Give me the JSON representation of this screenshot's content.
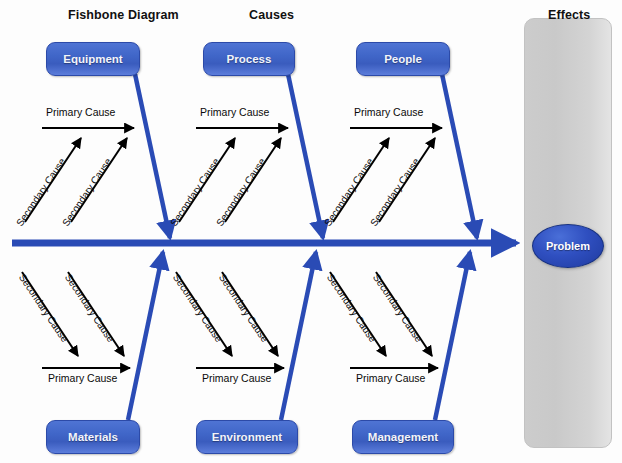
{
  "diagram": {
    "title": "Fishbone Diagram",
    "headings": [
      {
        "label": "Fishbone Diagram",
        "x": 68,
        "y": 8
      },
      {
        "label": "Causes",
        "x": 249,
        "y": 8
      },
      {
        "label": "Effects",
        "x": 548,
        "y": 8
      }
    ],
    "spine": {
      "color": "#2a4bb5",
      "start_x": 12,
      "end_x": 522,
      "y": 243,
      "thickness": 7
    },
    "effects_panel": {
      "label": "Effects",
      "x": 524,
      "y": 18,
      "width": 86,
      "height": 428,
      "color": "#cfcfcf"
    },
    "problem": {
      "label": "Problem",
      "x": 532,
      "y": 224,
      "width": 70,
      "height": 42,
      "color": "#2f4fc0"
    },
    "accent_color": "#3a5cbe",
    "arrow_color": "#000000",
    "branch_color": "#2a4bb5",
    "primary_cause_label": "Primary Cause",
    "secondary_cause_label": "Secondary Cause",
    "categories_top": [
      {
        "label": "Equipment",
        "box_x": 46,
        "box_y": 42,
        "box_w": 92,
        "box_h": 32
      },
      {
        "label": "Process",
        "box_x": 203,
        "box_y": 42,
        "box_w": 90,
        "box_h": 32
      },
      {
        "label": "People",
        "box_x": 356,
        "box_y": 42,
        "box_w": 92,
        "box_h": 32
      }
    ],
    "categories_bottom": [
      {
        "label": "Materials",
        "box_x": 46,
        "box_y": 420,
        "box_w": 92,
        "box_h": 32
      },
      {
        "label": "Environment",
        "box_x": 196,
        "box_y": 420,
        "box_w": 100,
        "box_h": 32
      },
      {
        "label": "Management",
        "box_x": 352,
        "box_y": 420,
        "box_w": 100,
        "box_h": 32
      }
    ],
    "branches_top": [
      {
        "category": "Equipment",
        "primary_label": "Primary Cause",
        "secondary_labels": [
          "Secondary Cause",
          "Secondary Cause"
        ]
      },
      {
        "category": "Process",
        "primary_label": "Primary Cause",
        "secondary_labels": [
          "Secondary Cause",
          "Secondary Cause"
        ]
      },
      {
        "category": "People",
        "primary_label": "Primary Cause",
        "secondary_labels": [
          "Secondary Cause",
          "Secondary Cause"
        ]
      }
    ],
    "branches_bottom": [
      {
        "category": "Materials",
        "primary_label": "Primary Cause",
        "secondary_labels": [
          "Secondary Cause",
          "Secondary Cause"
        ]
      },
      {
        "category": "Environment",
        "primary_label": "Primary Cause",
        "secondary_labels": [
          "Secondary Cause",
          "Secondary Cause"
        ]
      },
      {
        "category": "Management",
        "primary_label": "Primary Cause",
        "secondary_labels": [
          "Secondary Cause",
          "Secondary Cause"
        ]
      }
    ]
  }
}
